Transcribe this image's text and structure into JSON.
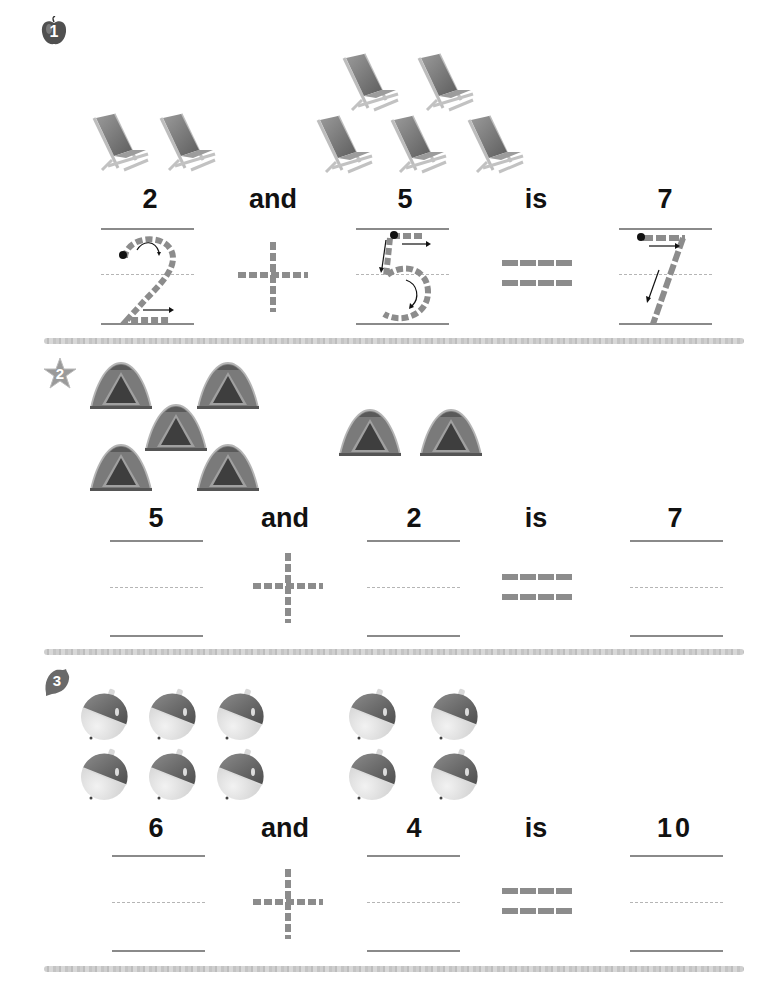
{
  "worksheet": {
    "exercises": [
      {
        "number": "1",
        "badge_icon": "apple-icon",
        "picture_icon": "deck-chair-icon",
        "group_a_count": 2,
        "group_b_count": 5,
        "words": [
          "2",
          "and",
          "5",
          "is",
          "7"
        ],
        "trace_digits": [
          "2",
          "5",
          "7"
        ],
        "plus_symbol": "+",
        "equals_symbol": "="
      },
      {
        "number": "2",
        "badge_icon": "star-icon",
        "picture_icon": "tent-icon",
        "group_a_count": 5,
        "group_b_count": 2,
        "words": [
          "5",
          "and",
          "2",
          "is",
          "7"
        ],
        "plus_symbol": "+",
        "equals_symbol": "="
      },
      {
        "number": "3",
        "badge_icon": "leaf-icon",
        "picture_icon": "ornament-ball-icon",
        "group_a_count": 6,
        "group_b_count": 4,
        "words": [
          "6",
          "and",
          "4",
          "is",
          "10"
        ],
        "plus_symbol": "+",
        "equals_symbol": "="
      }
    ]
  },
  "colors": {
    "trace_gray": "#8c8c8c",
    "rule_gray": "#8a8a8a",
    "text": "#111111"
  }
}
